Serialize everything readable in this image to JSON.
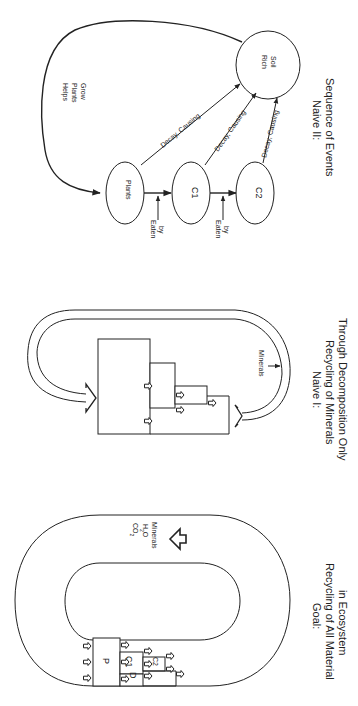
{
  "figure": {
    "orientation": "rotated-90-clockwise",
    "panels": [
      {
        "id": "goal",
        "caption": [
          "Goal:",
          "Recycling of All Material",
          "in Ecosystem"
        ],
        "boxes": [
          "P",
          "C1",
          "D",
          "C2"
        ],
        "flow_labels": [
          "CO2",
          "H2O",
          "Minerals"
        ],
        "flow_label_parts": {
          "co": "CO",
          "co_sub": "2",
          "h": "H",
          "h_sub": "2",
          "o": "O",
          "minerals": "Minerals"
        }
      },
      {
        "id": "naive1",
        "caption": [
          "Naive I:",
          "Recycling of Minerals",
          "Through Decomposition Only"
        ],
        "flow_label": "Minerals"
      },
      {
        "id": "naive2",
        "caption": [
          "Naive II:",
          "Sequence of Events"
        ],
        "nodes": [
          {
            "id": "plants",
            "label": "Plants"
          },
          {
            "id": "c1",
            "label": "C1"
          },
          {
            "id": "c2",
            "label": "C2"
          },
          {
            "id": "soil",
            "label_lines": [
              "Rich",
              "Soil"
            ]
          }
        ],
        "edges": {
          "decay_label": "Decay, Causing",
          "eaten_lines": [
            "Eaten",
            "by"
          ],
          "helps_lines": [
            "Helps",
            "Plants",
            "Grow"
          ]
        }
      }
    ]
  }
}
